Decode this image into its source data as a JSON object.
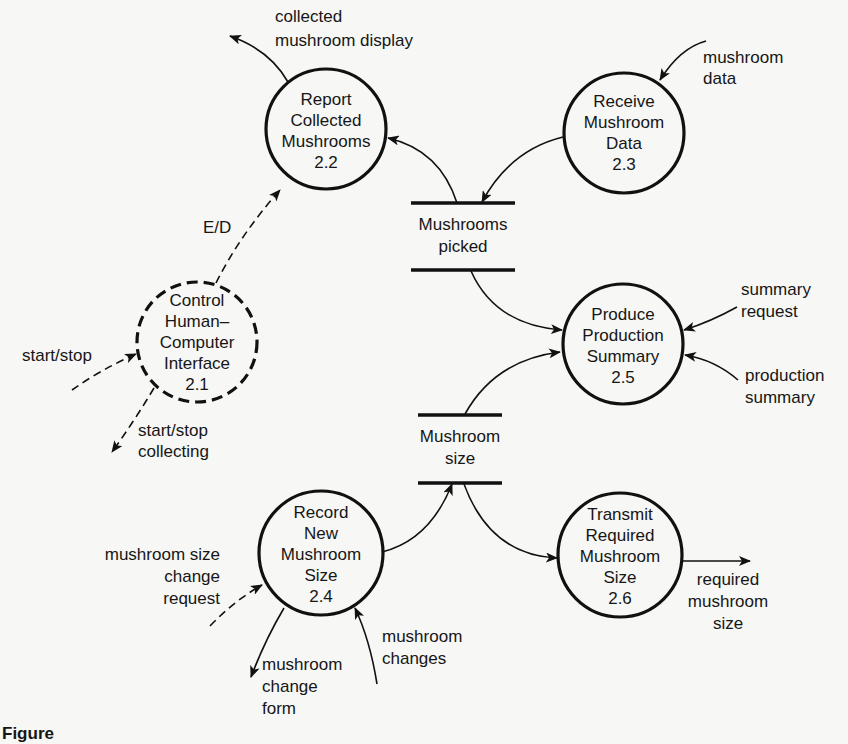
{
  "diagram": {
    "type": "data-flow-diagram",
    "processes": [
      {
        "id": "2.1",
        "lines": [
          "Control",
          "Human–",
          "Computer",
          "Interface",
          "2.1"
        ],
        "style": "dashed",
        "cx": 197,
        "cy": 342,
        "r": 60
      },
      {
        "id": "2.2",
        "lines": [
          "Report",
          "Collected",
          "Mushrooms",
          "2.2"
        ],
        "style": "solid",
        "cx": 326,
        "cy": 129,
        "r": 60
      },
      {
        "id": "2.3",
        "lines": [
          "Receive",
          "Mushroom",
          "Data",
          "2.3"
        ],
        "style": "solid",
        "cx": 624,
        "cy": 133,
        "r": 60
      },
      {
        "id": "2.4",
        "lines": [
          "Record",
          "New",
          "Mushroom",
          "Size",
          "2.4"
        ],
        "style": "solid",
        "cx": 321,
        "cy": 553,
        "r": 62
      },
      {
        "id": "2.5",
        "lines": [
          "Produce",
          "Production",
          "Summary",
          "2.5"
        ],
        "style": "solid",
        "cx": 623,
        "cy": 344,
        "r": 60
      },
      {
        "id": "2.6",
        "lines": [
          "Transmit",
          "Required",
          "Mushroom",
          "Size",
          "2.6"
        ],
        "style": "solid",
        "cx": 620,
        "cy": 555,
        "r": 62
      }
    ],
    "stores": [
      {
        "id": "mushrooms-picked",
        "lines": [
          "Mushrooms",
          "picked"
        ]
      },
      {
        "id": "mushroom-size",
        "lines": [
          "Mushroom",
          "size"
        ]
      }
    ],
    "flows": [
      {
        "id": "collected-mushroom-display",
        "lines": [
          "collected",
          "mushroom display"
        ],
        "from": "2.2",
        "to": "external",
        "style": "solid"
      },
      {
        "id": "mushroom-data",
        "lines": [
          "mushroom",
          "data"
        ],
        "from": "external",
        "to": "2.3",
        "style": "solid"
      },
      {
        "id": "ed",
        "lines": [
          "E/D"
        ],
        "from": "2.1",
        "to": "2.2",
        "style": "dashed"
      },
      {
        "id": "start-stop-in",
        "lines": [
          "start/stop"
        ],
        "from": "external",
        "to": "2.1",
        "style": "dashed"
      },
      {
        "id": "start-stop-collecting",
        "lines": [
          "start/stop",
          "collecting"
        ],
        "from": "2.1",
        "to": "external",
        "style": "dashed"
      },
      {
        "id": "summary-request",
        "lines": [
          "summary",
          "request"
        ],
        "from": "external",
        "to": "2.5",
        "style": "solid"
      },
      {
        "id": "production-summary",
        "lines": [
          "production",
          "summary"
        ],
        "from": "external",
        "to": "2.5",
        "style": "solid"
      },
      {
        "id": "mushroom-size-change-request",
        "lines": [
          "mushroom size",
          "change",
          "request"
        ],
        "from": "external",
        "to": "2.4",
        "style": "dashed"
      },
      {
        "id": "mushroom-change-form",
        "lines": [
          "mushroom",
          "change",
          "form"
        ],
        "from": "2.4",
        "to": "external",
        "style": "solid"
      },
      {
        "id": "mushroom-changes",
        "lines": [
          "mushroom",
          "changes"
        ],
        "from": "external",
        "to": "2.4",
        "style": "solid"
      },
      {
        "id": "required-mushroom-size",
        "lines": [
          "required",
          "mushroom",
          "size"
        ],
        "from": "2.6",
        "to": "external",
        "style": "solid"
      },
      {
        "id": "picked-to-2.2",
        "lines": [],
        "from": "mushrooms-picked",
        "to": "2.2",
        "style": "solid"
      },
      {
        "id": "2.3-to-picked",
        "lines": [],
        "from": "2.3",
        "to": "mushrooms-picked",
        "style": "solid"
      },
      {
        "id": "picked-to-2.5",
        "lines": [],
        "from": "mushrooms-picked",
        "to": "2.5",
        "style": "solid"
      },
      {
        "id": "size-to-2.5",
        "lines": [],
        "from": "mushroom-size",
        "to": "2.5",
        "style": "solid"
      },
      {
        "id": "2.4-to-size",
        "lines": [],
        "from": "2.4",
        "to": "mushroom-size",
        "style": "solid"
      },
      {
        "id": "size-to-2.6",
        "lines": [],
        "from": "mushroom-size",
        "to": "2.6",
        "style": "solid"
      }
    ]
  },
  "caption": "Figure"
}
